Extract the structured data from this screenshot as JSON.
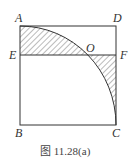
{
  "figure": {
    "caption": "图 11.28(a)",
    "points": {
      "A": "A",
      "B": "B",
      "C": "C",
      "D": "D",
      "E": "E",
      "F": "F",
      "O": "O"
    }
  }
}
